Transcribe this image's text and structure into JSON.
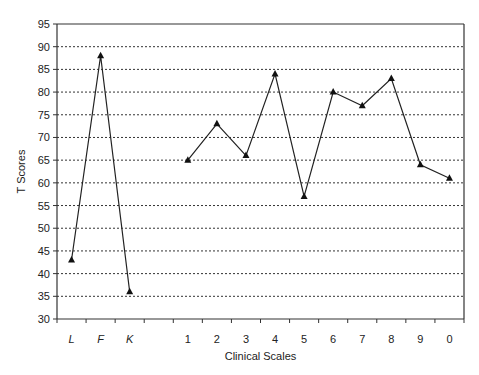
{
  "chart_data": {
    "type": "line",
    "title": "",
    "xlabel": "Clinical Scales",
    "ylabel": "T Scores",
    "ylim": [
      30,
      95
    ],
    "yticks": [
      30,
      35,
      40,
      45,
      50,
      55,
      60,
      65,
      70,
      75,
      80,
      85,
      90,
      95
    ],
    "grid": "horizontal dashed",
    "categories": [
      "L",
      "F",
      "K",
      "",
      "1",
      "2",
      "3",
      "4",
      "5",
      "6",
      "7",
      "8",
      "9",
      "0"
    ],
    "series": [
      {
        "name": "Validity Scales",
        "x": [
          "L",
          "F",
          "K"
        ],
        "values": [
          43,
          88,
          36
        ]
      },
      {
        "name": "Clinical Scales",
        "x": [
          "1",
          "2",
          "3",
          "4",
          "5",
          "6",
          "7",
          "8",
          "9",
          "0"
        ],
        "values": [
          65,
          73,
          66,
          84,
          57,
          80,
          77,
          83,
          64,
          61
        ]
      }
    ],
    "marker": "triangle"
  }
}
